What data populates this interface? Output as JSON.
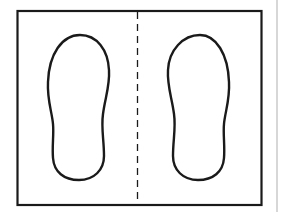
{
  "diagram": {
    "colors": {
      "stroke": "#1a1a1a",
      "divider": "#bdbdbd",
      "background": "#ffffff"
    },
    "elements": [
      {
        "name": "frame-rectangle"
      },
      {
        "name": "fold-line-dashed"
      },
      {
        "name": "left-footprint"
      },
      {
        "name": "right-footprint"
      }
    ]
  }
}
